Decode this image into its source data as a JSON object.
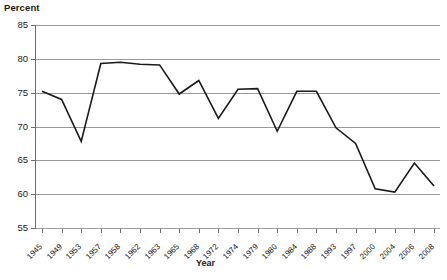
{
  "chart_data": {
    "type": "line",
    "title": "",
    "xlabel": "Year",
    "ylabel": "Percent",
    "ylim": [
      55,
      85
    ],
    "ytick_values": [
      55,
      60,
      65,
      70,
      75,
      80,
      85
    ],
    "ytick_labels": [
      "55",
      "60",
      "65",
      "70",
      "75",
      "80",
      "85"
    ],
    "grid": true,
    "legend": null,
    "categories": [
      "1945",
      "1949",
      "1953",
      "1957",
      "1958",
      "1962",
      "1963",
      "1965",
      "1968",
      "1972",
      "1974",
      "1979",
      "1980",
      "1984",
      "1988",
      "1993",
      "1997",
      "2000",
      "2004",
      "2006",
      "2008"
    ],
    "values": [
      75.2,
      74.0,
      67.8,
      79.3,
      79.5,
      79.2,
      79.1,
      74.8,
      76.8,
      71.2,
      75.5,
      75.6,
      69.3,
      75.2,
      75.2,
      69.8,
      67.5,
      60.8,
      60.3,
      64.6,
      61.2
    ],
    "series": [
      {
        "name": "Percent",
        "color": "#1a1a1a",
        "values": [
          75.2,
          74.0,
          67.8,
          79.3,
          79.5,
          79.2,
          79.1,
          74.8,
          76.8,
          71.2,
          75.5,
          75.6,
          69.3,
          75.2,
          75.2,
          69.8,
          67.5,
          60.8,
          60.3,
          64.6,
          61.2
        ]
      }
    ]
  },
  "axes": {
    "y_title": "Percent",
    "x_title": "Year"
  },
  "colors": {
    "line": "#1a1a1a",
    "grid": "#9a9a9a",
    "axis": "#6e6e6e",
    "text": "#1a1a1a",
    "background": "#ffffff"
  }
}
